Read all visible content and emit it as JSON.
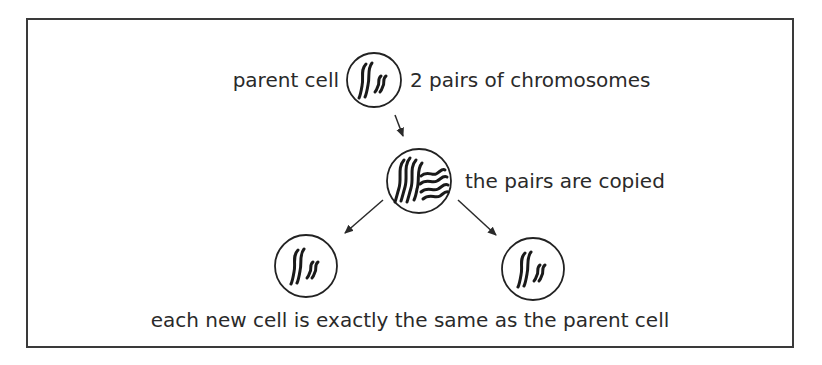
{
  "diagram": {
    "labels": {
      "parent_cell": "parent cell",
      "chromosome_pairs": "2 pairs of chromosomes",
      "copied": "the pairs are copied",
      "result": "each new cell is exactly the same as the parent cell"
    },
    "nodes": [
      {
        "id": "parent",
        "label": "parent cell",
        "chromosome_pairs": 2
      },
      {
        "id": "copied",
        "label": "the pairs are copied",
        "chromosome_pairs": 4
      },
      {
        "id": "daughter-left",
        "label": "new cell",
        "chromosome_pairs": 2
      },
      {
        "id": "daughter-right",
        "label": "new cell",
        "chromosome_pairs": 2
      }
    ],
    "edges": [
      {
        "from": "parent",
        "to": "copied"
      },
      {
        "from": "copied",
        "to": "daughter-left"
      },
      {
        "from": "copied",
        "to": "daughter-right"
      }
    ],
    "colors": {
      "ink": "#222222",
      "background": "#ffffff"
    }
  }
}
